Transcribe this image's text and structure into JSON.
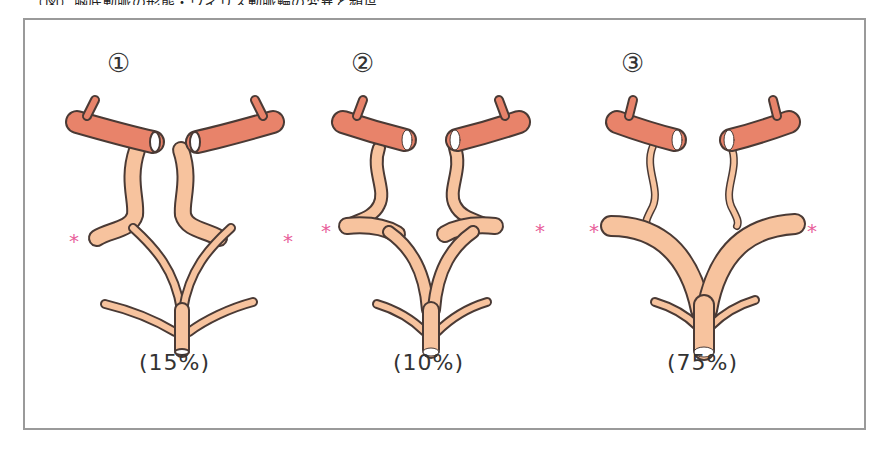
{
  "header": {
    "caption_fragment": "（図）脳底動脈の形態・ウィリス動脈輪の変異と頻度"
  },
  "colors": {
    "artery_upper": "#E8836A",
    "artery_lower": "#F7C39E",
    "outline": "#4a3a35",
    "asterisk": "#E8609A",
    "frame_border": "#9a9a9a",
    "text": "#333333"
  },
  "panels": [
    {
      "number": "①",
      "percent_label": "(15%)",
      "left_marker": "*",
      "right_marker": "*"
    },
    {
      "number": "②",
      "percent_label": "(10%)",
      "left_marker": "*",
      "right_marker": "*"
    },
    {
      "number": "③",
      "percent_label": "(75%)",
      "left_marker": "*",
      "right_marker": "*"
    }
  ]
}
